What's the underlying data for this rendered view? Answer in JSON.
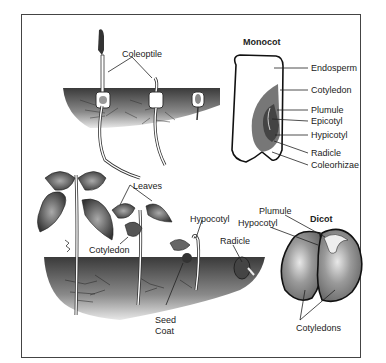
{
  "monocot": {
    "title": "Monocot",
    "seedling_label": "Coleoptile",
    "parts": [
      "Endosperm",
      "Cotyledon",
      "Plumule",
      "Epicotyl",
      "Hypicotyl",
      "Radicle",
      "Coleorhizae"
    ]
  },
  "dicot": {
    "title": "Dicot",
    "seed_labels": {
      "plumule": "Plumule",
      "hypocotyl": "Hypocotyl",
      "cotyledons": "Cotyledons"
    },
    "seedling_labels": {
      "leaves": "Leaves",
      "cotyledon": "Cotyledon",
      "hypocotyl": "Hypocotyl",
      "radicle": "Radicle",
      "seed_coat_line1": "Seed",
      "seed_coat_line2": "Coat"
    }
  }
}
